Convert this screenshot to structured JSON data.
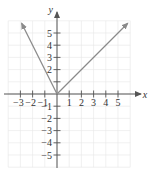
{
  "chart_data": {
    "type": "line",
    "title": "",
    "xlabel": "x",
    "ylabel": "y",
    "xlim": [
      -4,
      6
    ],
    "ylim": [
      -6,
      6
    ],
    "grid": true,
    "x_ticks": [
      -3,
      -2,
      -1,
      1,
      2,
      3,
      4,
      5
    ],
    "x_tick_labels": [
      "−3",
      "−2",
      "−1",
      "1",
      "2",
      "3",
      "4",
      "5"
    ],
    "y_ticks": [
      5,
      4,
      3,
      2,
      1,
      -1,
      -2,
      -3,
      -4,
      -5
    ],
    "y_tick_labels": [
      "5",
      "4",
      "3",
      "2",
      "",
      "−1",
      "−2",
      "−3",
      "−4",
      "−5"
    ],
    "series": [
      {
        "name": "f(x) = -2x, x < 0",
        "x": [
          0,
          -2.9
        ],
        "y": [
          0,
          5.8
        ],
        "arrow_end": true
      },
      {
        "name": "f(x) = x, x >= 0",
        "x": [
          0,
          5.8
        ],
        "y": [
          0,
          5.8
        ],
        "arrow_end": true
      }
    ],
    "colors": {
      "curve": "#8a8a8a",
      "axis": "#555555",
      "grid": "#e6e6e6"
    }
  }
}
